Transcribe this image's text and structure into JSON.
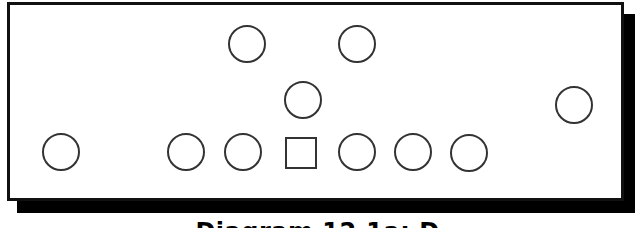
{
  "diagram": {
    "frame": {
      "border_color": "#111111",
      "shadow_color": "#000000",
      "background": "#ffffff"
    },
    "players": [
      {
        "id": "p1",
        "shape": "circle",
        "cx": 247,
        "cy": 44
      },
      {
        "id": "p2",
        "shape": "circle",
        "cx": 357,
        "cy": 44
      },
      {
        "id": "p3",
        "shape": "circle",
        "cx": 303,
        "cy": 100
      },
      {
        "id": "p4",
        "shape": "circle",
        "cx": 574,
        "cy": 105
      },
      {
        "id": "p5",
        "shape": "circle",
        "cx": 61,
        "cy": 152
      },
      {
        "id": "p6",
        "shape": "circle",
        "cx": 186,
        "cy": 152
      },
      {
        "id": "p7",
        "shape": "circle",
        "cx": 243,
        "cy": 152
      },
      {
        "id": "p8",
        "shape": "square",
        "cx": 301,
        "cy": 153
      },
      {
        "id": "p9",
        "shape": "circle",
        "cx": 357,
        "cy": 152
      },
      {
        "id": "p10",
        "shape": "circle",
        "cx": 413,
        "cy": 152
      },
      {
        "id": "p11",
        "shape": "circle",
        "cx": 469,
        "cy": 153
      }
    ],
    "caption": "Diagram 12.1a: D"
  }
}
